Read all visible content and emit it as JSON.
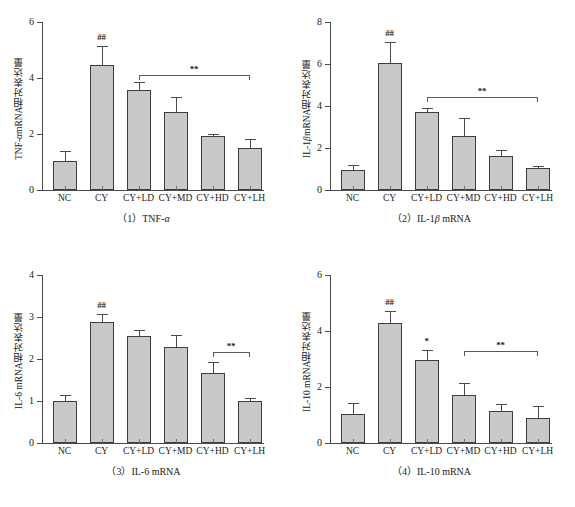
{
  "figure": {
    "background": "#ffffff",
    "bar_fill": "#c9c9c9",
    "bar_stroke": "#3d3d3d",
    "axis_color": "#4a4a4a"
  },
  "chart_data": [
    {
      "type": "bar",
      "panel_number": "（1）",
      "caption": "（1）TNF-α",
      "caption_main": "TNF-",
      "caption_italic": "α",
      "title": "",
      "ylabel_prefix": "TNF-",
      "ylabel_italic": "α",
      "ylabel_suffix": " mRNA相对表达量",
      "ylabel": "TNF-α mRNA相对表达量",
      "xlabel": "",
      "ylim": [
        0,
        6
      ],
      "yticks": [
        0,
        2,
        4,
        6
      ],
      "ytick_labels": [
        "0",
        "2",
        "4",
        "6"
      ],
      "grid": false,
      "legend": "none",
      "categories": [
        "NC",
        "CY",
        "CY+LD",
        "CY+MD",
        "CY+HD",
        "CY+LH"
      ],
      "values": [
        1.02,
        4.45,
        3.57,
        2.8,
        1.92,
        1.5
      ],
      "errors": [
        0.38,
        0.68,
        0.29,
        0.52,
        0.08,
        0.33
      ],
      "annotations": [
        {
          "kind": "marker",
          "text": "##",
          "category": "CY"
        }
      ],
      "brackets": [
        {
          "text": "**",
          "from": "CY+LD",
          "to": "CY+LH",
          "y_value": 4.12
        }
      ]
    },
    {
      "type": "bar",
      "panel_number": "（2）",
      "caption": "（2）IL-1β mRNA",
      "caption_main": "IL-1",
      "caption_italic": "β",
      "caption_tail": " mRNA",
      "ylabel_prefix": "IL-1",
      "ylabel_italic": "β",
      "ylabel_suffix": " mRNA相对表达量",
      "ylabel": "IL-1β mRNA相对表达量",
      "xlabel": "",
      "ylim": [
        0,
        8
      ],
      "yticks": [
        0,
        2,
        4,
        6,
        8
      ],
      "ytick_labels": [
        "0",
        "2",
        "4",
        "6",
        "8"
      ],
      "grid": false,
      "legend": "none",
      "categories": [
        "NC",
        "CY",
        "CY+LD",
        "CY+MD",
        "CY+HD",
        "CY+LH"
      ],
      "values": [
        0.97,
        6.05,
        3.7,
        2.58,
        1.63,
        1.03
      ],
      "errors": [
        0.2,
        1.0,
        0.22,
        0.87,
        0.27,
        0.09
      ],
      "annotations": [
        {
          "kind": "marker",
          "text": "##",
          "category": "CY"
        }
      ],
      "brackets": [
        {
          "text": "**",
          "from": "CY+LD",
          "to": "CY+LH",
          "y_value": 4.45
        }
      ]
    },
    {
      "type": "bar",
      "panel_number": "（3）",
      "caption": "（3）IL-6 mRNA",
      "caption_main": "IL-6 mRNA",
      "caption_italic": "",
      "ylabel_prefix": "IL-6 mRNA相对表达量",
      "ylabel_italic": "",
      "ylabel_suffix": "",
      "ylabel": "IL-6 mRNA相对表达量",
      "xlabel": "",
      "ylim": [
        0,
        4
      ],
      "yticks": [
        0,
        1,
        2,
        3,
        4
      ],
      "ytick_labels": [
        "0",
        "1",
        "2",
        "3",
        "4"
      ],
      "grid": false,
      "legend": "none",
      "categories": [
        "NC",
        "CY",
        "CY+LD",
        "CY+MD",
        "CY+HD",
        "CY+LH"
      ],
      "values": [
        1.01,
        2.89,
        2.54,
        2.29,
        1.67,
        1.01
      ],
      "errors": [
        0.14,
        0.17,
        0.16,
        0.27,
        0.25,
        0.07
      ],
      "annotations": [
        {
          "kind": "marker",
          "text": "##",
          "category": "CY"
        }
      ],
      "brackets": [
        {
          "text": "**",
          "from": "CY+HD",
          "to": "CY+LH",
          "y_value": 2.17
        }
      ]
    },
    {
      "type": "bar",
      "panel_number": "（4）",
      "caption": "（4）IL-10 mRNA",
      "caption_main": "IL-10 mRNA",
      "caption_italic": "",
      "ylabel_prefix": "IL-10 mRNA相对表达量",
      "ylabel_italic": "",
      "ylabel_suffix": "",
      "ylabel": "IL-10 mRNA相对表达量",
      "xlabel": "",
      "ylim": [
        0,
        6
      ],
      "yticks": [
        0,
        2,
        4,
        6
      ],
      "ytick_labels": [
        "0",
        "2",
        "4",
        "6"
      ],
      "grid": false,
      "legend": "none",
      "categories": [
        "NC",
        "CY",
        "CY+LD",
        "CY+MD",
        "CY+HD",
        "CY+LH"
      ],
      "values": [
        1.05,
        4.28,
        2.95,
        1.7,
        1.13,
        0.88
      ],
      "errors": [
        0.38,
        0.42,
        0.38,
        0.45,
        0.28,
        0.45
      ],
      "annotations": [
        {
          "kind": "marker",
          "text": "##",
          "category": "CY"
        },
        {
          "kind": "marker",
          "text": "*",
          "category": "CY+LD"
        }
      ],
      "brackets": [
        {
          "text": "**",
          "from": "CY+MD",
          "to": "CY+LH",
          "y_value": 3.28
        }
      ]
    }
  ]
}
